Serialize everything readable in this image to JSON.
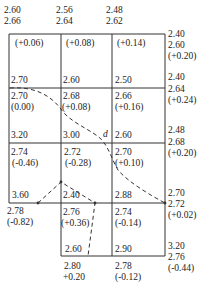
{
  "top_labels": [
    {
      "a": "2.60",
      "b": "2.66"
    },
    {
      "a": "2.56",
      "b": "2.64"
    },
    {
      "a": "2.48",
      "b": "2.62"
    }
  ],
  "right_labels": [
    {
      "a": "2.40",
      "b": "2.60",
      "c": "(+0.20)"
    },
    {
      "a": "2.40",
      "b": "2.64",
      "c": "(+0.24)"
    },
    {
      "a": "2.48",
      "b": "2.68",
      "c": "(+0.20)"
    },
    {
      "a": "2.70",
      "b": "2.72",
      "c": "(+0.02)"
    },
    {
      "a": "3.20",
      "b": "2.76",
      "c": "(-0.44)"
    }
  ],
  "cells": {
    "r1": [
      {
        "top": "(+0.06)",
        "bottom": "2.70"
      },
      {
        "top": "(+0.08)",
        "bottom": "2.60"
      },
      {
        "top": "(+0.14)",
        "bottom": "2.50"
      }
    ],
    "r2": [
      {
        "top": "2.70",
        "mid": "(0.00)",
        "bottom": "3.20"
      },
      {
        "top": "2.68",
        "mid": "(+0.08)",
        "bottom": "3.00"
      },
      {
        "top": "2.66",
        "mid": "(+0.16)",
        "bottom": "2.60"
      }
    ],
    "r3": [
      {
        "top": "2.74",
        "mid": "(-0.46)",
        "bottom": "3.60"
      },
      {
        "top": "2.72",
        "mid": "(-0.28)",
        "bottom": "2.40"
      },
      {
        "top": "2.70",
        "mid": "(+0.10)",
        "bottom": "2.88"
      }
    ],
    "r4": [
      {
        "top": "2.76",
        "mid": "(+0.36)",
        "bottom": "2.60"
      },
      {
        "top": "2.74",
        "mid": "(-0.14)",
        "bottom": "2.90"
      }
    ]
  },
  "left_below": {
    "a": "2.78",
    "b": "(-0.82)"
  },
  "bottom_labels": [
    {
      "a": "2.80",
      "b": "+0.20"
    },
    {
      "a": "2.78",
      "b": "(-0.12)"
    }
  ],
  "curve_label": "d"
}
